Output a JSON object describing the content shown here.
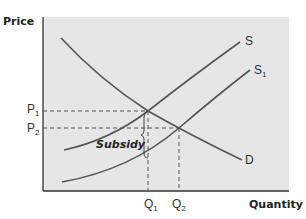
{
  "diagram": {
    "type": "supply-demand-subsidy",
    "y_axis_label": "Price",
    "x_axis_label": "Quantity",
    "curves": [
      {
        "id": "D",
        "label": "D",
        "kind": "demand"
      },
      {
        "id": "S",
        "label": "S",
        "kind": "supply"
      },
      {
        "id": "S1",
        "label": "S",
        "subscript": "1",
        "kind": "supply-after-subsidy"
      }
    ],
    "price_levels": [
      {
        "label": "P",
        "subscript": "1"
      },
      {
        "label": "P",
        "subscript": "2"
      }
    ],
    "quantity_levels": [
      {
        "label": "Q",
        "subscript": "1"
      },
      {
        "label": "Q",
        "subscript": "2"
      }
    ],
    "annotation": "Subsidy",
    "colors": {
      "panel_fill": "#e6e6e6",
      "curve": "#555555",
      "axis": "#333333",
      "dashed": "#555555"
    }
  }
}
